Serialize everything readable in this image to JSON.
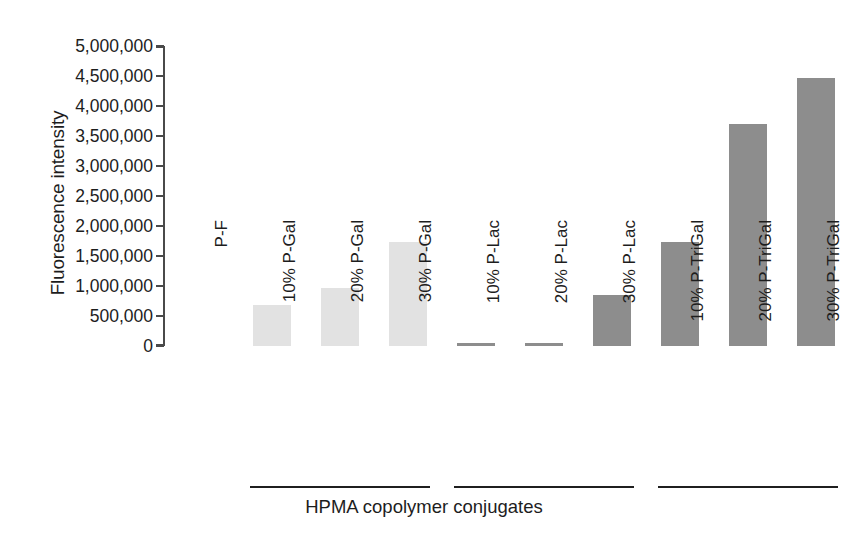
{
  "chart_data": {
    "type": "bar",
    "title": "",
    "xlabel": "HPMA copolymer conjugates",
    "ylabel": "Fluorescence intensity",
    "ylim": [
      0,
      5000000
    ],
    "ytick_step": 500000,
    "grid": false,
    "legend": "none",
    "categories": [
      "P-F",
      "10% P-Gal",
      "20% P-Gal",
      "30% P-Gal",
      "10% P-Lac",
      "20% P-Lac",
      "30% P-Lac",
      "10% P-TriGal",
      "20% P-TriGal",
      "30% P-TriGal"
    ],
    "values": [
      0,
      680000,
      960000,
      1730000,
      50000,
      50000,
      850000,
      1740000,
      3700000,
      4460000
    ],
    "bar_colors": [
      "#ffffff",
      "#e2e2e2",
      "#e2e2e2",
      "#e2e2e2",
      "#8d8d8d",
      "#8d8d8d",
      "#8d8d8d",
      "#8d8d8d",
      "#8d8d8d",
      "#8d8d8d"
    ],
    "ytick_labels": [
      "5,000,000",
      "4,500,000",
      "4,000,000",
      "3,500,000",
      "3,000,000",
      "2,500,000",
      "2,000,000",
      "1,500,000",
      "1,000,000",
      "500,000",
      "0"
    ],
    "ytick_values": [
      5000000,
      4500000,
      4000000,
      3500000,
      3000000,
      2500000,
      2000000,
      1500000,
      1000000,
      500000,
      0
    ],
    "groups": [
      {
        "label": "P-Gal",
        "first_index": 1,
        "last_index": 3
      },
      {
        "label": "P-Lac",
        "first_index": 4,
        "last_index": 6
      },
      {
        "label": "P-TriGal",
        "first_index": 7,
        "last_index": 9
      }
    ],
    "axis_color": "#4a4a4a",
    "text_color": "#1d1d1d"
  }
}
